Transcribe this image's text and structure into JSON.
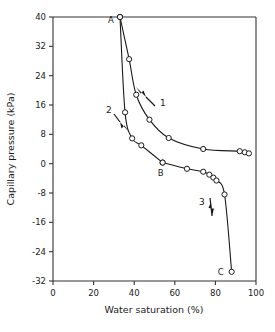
{
  "chart_data": {
    "type": "line",
    "title": "",
    "xlabel": "Water saturation (%)",
    "ylabel": "Capillary pressure (kPa)",
    "xlim": [
      0,
      100
    ],
    "ylim": [
      -32,
      40
    ],
    "xticks": [
      0,
      20,
      40,
      60,
      80,
      100
    ],
    "yticks": [
      40,
      32,
      24,
      16,
      8,
      0,
      -8,
      -16,
      -24,
      -32
    ],
    "xtick_labels": [
      "0",
      "20",
      "40",
      "60",
      "80",
      "100"
    ],
    "ytick_labels": [
      "40",
      "32",
      "24",
      "16",
      "8",
      "0",
      "-8",
      "-16",
      "-24",
      "-32"
    ],
    "grid": false,
    "legend": "none",
    "marker": "open-circle",
    "series": [
      {
        "name": "Branch 1 (imbibition, A to right)",
        "annotation": "1",
        "points": [
          {
            "x": 33.0,
            "y": 40.0
          },
          {
            "x": 37.5,
            "y": 28.5
          },
          {
            "x": 41.0,
            "y": 18.8
          },
          {
            "x": 47.5,
            "y": 12.0
          },
          {
            "x": 57.0,
            "y": 7.0
          },
          {
            "x": 74.0,
            "y": 4.0
          },
          {
            "x": 92.0,
            "y": 3.4
          },
          {
            "x": 94.5,
            "y": 3.1
          },
          {
            "x": 96.5,
            "y": 2.8
          }
        ]
      },
      {
        "name": "Branch 2 (A to B)",
        "annotation": "2",
        "points": [
          {
            "x": 33.0,
            "y": 40.0
          },
          {
            "x": 35.5,
            "y": 14.0
          },
          {
            "x": 39.0,
            "y": 6.9
          },
          {
            "x": 43.5,
            "y": 5.0
          },
          {
            "x": 54.0,
            "y": 0.3
          }
        ]
      },
      {
        "name": "Branch 3 (B to C drainage)",
        "annotation": "3",
        "points": [
          {
            "x": 54.0,
            "y": 0.3
          },
          {
            "x": 66.0,
            "y": -1.4
          },
          {
            "x": 74.0,
            "y": -2.2
          },
          {
            "x": 77.0,
            "y": -3.0
          },
          {
            "x": 79.0,
            "y": -3.8
          },
          {
            "x": 80.5,
            "y": -4.6
          },
          {
            "x": 84.5,
            "y": -8.4
          },
          {
            "x": 88.0,
            "y": -29.5
          }
        ]
      }
    ],
    "point_labels": [
      {
        "text": "A",
        "x": 33.0,
        "y": 40.0
      },
      {
        "text": "B",
        "x": 54.0,
        "y": 0.3
      },
      {
        "text": "C",
        "x": 88.0,
        "y": -29.5
      }
    ],
    "annotations": [
      {
        "text": "1",
        "note": "arrow pointing up-left along branch 1"
      },
      {
        "text": "2",
        "note": "arrow pointing down-right along branch 2"
      },
      {
        "text": "3",
        "note": "arrow pointing down along branch 3"
      }
    ],
    "colors": {
      "axis": "#333333",
      "curve": "#1a1a1a",
      "marker_fill": "#ffffff",
      "background": "#ffffff"
    }
  }
}
